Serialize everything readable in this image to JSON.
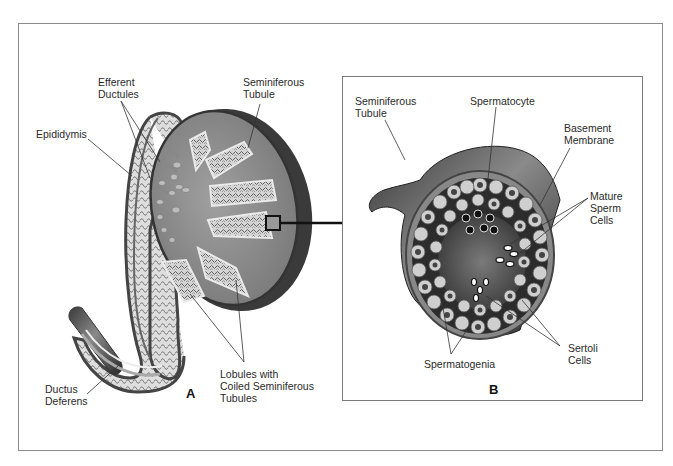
{
  "figure": {
    "panel_a": {
      "letter": "A",
      "labels": {
        "efferent_ductules": [
          "Efferent",
          "Ductules"
        ],
        "seminiferous_tubule": [
          "Seminiferous",
          "Tubule"
        ],
        "epididymis": [
          "Epididymis"
        ],
        "ductus_deferens": [
          "Ductus",
          "Deferens"
        ],
        "lobules": [
          "Lobules with",
          "Coiled Seminiferous",
          "Tubules"
        ]
      }
    },
    "panel_b": {
      "letter": "B",
      "labels": {
        "seminiferous_tubule": [
          "Seminiferous",
          "Tubule"
        ],
        "spermatocyte": [
          "Spermatocyte"
        ],
        "basement_membrane": [
          "Basement",
          "Membrane"
        ],
        "mature_sperm_cells": [
          "Mature",
          "Sperm",
          "Cells"
        ],
        "sertoli_cells": [
          "Sertoli",
          "Cells"
        ],
        "spermatogenia": [
          "Spermatogenia"
        ]
      }
    },
    "colors": {
      "testis_fill": "#8c8c8c",
      "testis_rim": "#3c3c3c",
      "tubule_fill": "#c8c8c8",
      "lumen": "#5a5a5a",
      "cell_light": "#d8d8d8",
      "cell_dark": "#3a3a3a",
      "line": "#333333"
    }
  }
}
